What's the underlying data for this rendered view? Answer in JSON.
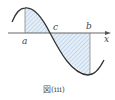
{
  "diagram": {
    "caption": "図(iii)",
    "labels": {
      "a": "a",
      "b": "b",
      "c": "c",
      "x": "x"
    },
    "colors": {
      "curve": "#333333",
      "axis": "#555555",
      "hatch": "#8fb4d8",
      "fill": "#e6eff8"
    }
  }
}
